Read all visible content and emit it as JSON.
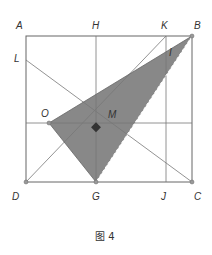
{
  "figure": {
    "caption": "图 4",
    "points": {
      "A": "A",
      "H": "H",
      "K": "K",
      "B": "B",
      "L": "L",
      "I": "I",
      "O": "O",
      "M": "M",
      "D": "D",
      "G": "G",
      "J": "J",
      "C": "C"
    },
    "colors": {
      "shade": "#888888",
      "line": "#777777",
      "frame": "#666666"
    }
  }
}
